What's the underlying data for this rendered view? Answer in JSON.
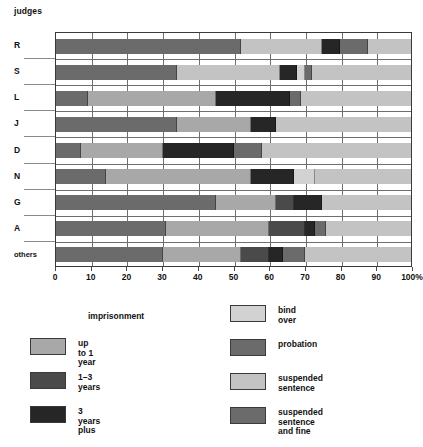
{
  "chart_data": {
    "type": "bar",
    "subtype": "stacked-horizontal-100pct",
    "title": "judges",
    "xlabel": "",
    "ylabel": "",
    "xlim": [
      0,
      100
    ],
    "xunit": "%",
    "grid": true,
    "legend_position": "bottom",
    "xticks": [
      {
        "value": 0,
        "label": "0"
      },
      {
        "value": 10,
        "label": "10"
      },
      {
        "value": 20,
        "label": "20"
      },
      {
        "value": 30,
        "label": "30"
      },
      {
        "value": 40,
        "label": "40"
      },
      {
        "value": 50,
        "label": "50"
      },
      {
        "value": 60,
        "label": "60"
      },
      {
        "value": 70,
        "label": "70"
      },
      {
        "value": 80,
        "label": "80"
      },
      {
        "value": 90,
        "label": "90"
      },
      {
        "value": 100,
        "label": "100%"
      }
    ],
    "categories": [
      "R",
      "S",
      "L",
      "J",
      "D",
      "N",
      "G",
      "A",
      "others"
    ],
    "series": [
      {
        "name": "up to 1 year",
        "key": "up_to_1_year",
        "color": "#a8a8a8",
        "values": [
          0,
          0,
          36,
          21,
          23,
          41,
          17,
          29,
          22
        ]
      },
      {
        "name": "1–3 years",
        "key": "one_to_three_years",
        "color": "#4a4a4a",
        "values": [
          0,
          0,
          0,
          0,
          0,
          0,
          5,
          10,
          10
        ]
      },
      {
        "name": "3 years plus",
        "key": "three_years_plus",
        "color": "#262626",
        "values": [
          5,
          5,
          21,
          7,
          20,
          12,
          8,
          3,
          4
        ]
      },
      {
        "name": "bind over",
        "key": "bind_over",
        "color": "#d2d2d2",
        "values": [
          0,
          2,
          0,
          0,
          0,
          6,
          0,
          0,
          0
        ]
      },
      {
        "name": "probation",
        "key": "probation",
        "color": "#6b6b6b",
        "values": [
          52,
          34,
          9,
          34,
          7,
          14,
          45,
          31,
          30
        ]
      },
      {
        "name": "suspended sentence",
        "key": "suspended_sentence",
        "color": "#c3c3c3",
        "values": [
          35,
          57,
          31,
          38,
          42,
          27,
          25,
          24,
          30
        ]
      },
      {
        "name": "suspended sentence and fine",
        "key": "suspended_and_fine",
        "color": "#6b6b6b",
        "values": [
          8,
          2,
          3,
          0,
          8,
          0,
          0,
          3,
          4
        ]
      }
    ],
    "rows": [
      {
        "category": "R",
        "segments": [
          {
            "key": "probation",
            "label": "probation",
            "start": 0,
            "end": 52,
            "value": 52,
            "color": "#6b6b6b"
          },
          {
            "key": "suspended_sentence",
            "label": "suspended sentence",
            "start": 52,
            "end": 75,
            "value": 23,
            "color": "#c3c3c3"
          },
          {
            "key": "three_years_plus",
            "label": "3 years plus",
            "start": 75,
            "end": 80,
            "value": 5,
            "color": "#262626"
          },
          {
            "key": "suspended_and_fine",
            "label": "suspended sentence and fine",
            "start": 80,
            "end": 88,
            "value": 8,
            "color": "#6b6b6b"
          },
          {
            "key": "suspended_sentence",
            "label": "suspended sentence",
            "start": 88,
            "end": 100,
            "value": 12,
            "color": "#c3c3c3"
          }
        ]
      },
      {
        "category": "S",
        "segments": [
          {
            "key": "probation",
            "label": "probation",
            "start": 0,
            "end": 34,
            "value": 34,
            "color": "#6b6b6b"
          },
          {
            "key": "suspended_sentence",
            "label": "suspended sentence",
            "start": 34,
            "end": 63,
            "value": 29,
            "color": "#c3c3c3"
          },
          {
            "key": "three_years_plus",
            "label": "3 years plus",
            "start": 63,
            "end": 68,
            "value": 5,
            "color": "#262626"
          },
          {
            "key": "bind_over",
            "label": "bind over",
            "start": 68,
            "end": 70,
            "value": 2,
            "color": "#d2d2d2"
          },
          {
            "key": "suspended_and_fine",
            "label": "suspended sentence and fine",
            "start": 70,
            "end": 72,
            "value": 2,
            "color": "#6b6b6b"
          },
          {
            "key": "suspended_sentence",
            "label": "suspended sentence",
            "start": 72,
            "end": 100,
            "value": 28,
            "color": "#c3c3c3"
          }
        ]
      },
      {
        "category": "L",
        "segments": [
          {
            "key": "probation",
            "label": "probation",
            "start": 0,
            "end": 9,
            "value": 9,
            "color": "#6b6b6b"
          },
          {
            "key": "up_to_1_year",
            "label": "up to 1 year",
            "start": 9,
            "end": 45,
            "value": 36,
            "color": "#a8a8a8"
          },
          {
            "key": "three_years_plus",
            "label": "3 years plus",
            "start": 45,
            "end": 66,
            "value": 21,
            "color": "#262626"
          },
          {
            "key": "suspended_and_fine",
            "label": "suspended sentence and fine",
            "start": 66,
            "end": 69,
            "value": 3,
            "color": "#6b6b6b"
          },
          {
            "key": "suspended_sentence",
            "label": "suspended sentence",
            "start": 69,
            "end": 100,
            "value": 31,
            "color": "#c3c3c3"
          }
        ]
      },
      {
        "category": "J",
        "segments": [
          {
            "key": "probation",
            "label": "probation",
            "start": 0,
            "end": 34,
            "value": 34,
            "color": "#6b6b6b"
          },
          {
            "key": "up_to_1_year",
            "label": "up to 1 year",
            "start": 34,
            "end": 55,
            "value": 21,
            "color": "#a8a8a8"
          },
          {
            "key": "three_years_plus",
            "label": "3 years plus",
            "start": 55,
            "end": 62,
            "value": 7,
            "color": "#262626"
          },
          {
            "key": "suspended_sentence",
            "label": "suspended sentence",
            "start": 62,
            "end": 100,
            "value": 38,
            "color": "#c3c3c3"
          }
        ]
      },
      {
        "category": "D",
        "segments": [
          {
            "key": "probation",
            "label": "probation",
            "start": 0,
            "end": 7,
            "value": 7,
            "color": "#6b6b6b"
          },
          {
            "key": "up_to_1_year",
            "label": "up to 1 year",
            "start": 7,
            "end": 30,
            "value": 23,
            "color": "#a8a8a8"
          },
          {
            "key": "three_years_plus",
            "label": "3 years plus",
            "start": 30,
            "end": 50,
            "value": 20,
            "color": "#262626"
          },
          {
            "key": "suspended_and_fine",
            "label": "suspended sentence and fine",
            "start": 50,
            "end": 58,
            "value": 8,
            "color": "#6b6b6b"
          },
          {
            "key": "suspended_sentence",
            "label": "suspended sentence",
            "start": 58,
            "end": 100,
            "value": 42,
            "color": "#c3c3c3"
          }
        ]
      },
      {
        "category": "N",
        "segments": [
          {
            "key": "probation",
            "label": "probation",
            "start": 0,
            "end": 14,
            "value": 14,
            "color": "#6b6b6b"
          },
          {
            "key": "up_to_1_year",
            "label": "up to 1 year",
            "start": 14,
            "end": 55,
            "value": 41,
            "color": "#a8a8a8"
          },
          {
            "key": "three_years_plus",
            "label": "3 years plus",
            "start": 55,
            "end": 67,
            "value": 12,
            "color": "#262626"
          },
          {
            "key": "bind_over",
            "label": "bind over",
            "start": 67,
            "end": 73,
            "value": 6,
            "color": "#d2d2d2"
          },
          {
            "key": "suspended_sentence",
            "label": "suspended sentence",
            "start": 73,
            "end": 100,
            "value": 27,
            "color": "#c3c3c3"
          }
        ]
      },
      {
        "category": "G",
        "segments": [
          {
            "key": "probation",
            "label": "probation",
            "start": 0,
            "end": 45,
            "value": 45,
            "color": "#6b6b6b"
          },
          {
            "key": "up_to_1_year",
            "label": "up to 1 year",
            "start": 45,
            "end": 62,
            "value": 17,
            "color": "#a8a8a8"
          },
          {
            "key": "one_to_three_years",
            "label": "1–3 years",
            "start": 62,
            "end": 67,
            "value": 5,
            "color": "#4a4a4a"
          },
          {
            "key": "three_years_plus",
            "label": "3 years plus",
            "start": 67,
            "end": 75,
            "value": 8,
            "color": "#262626"
          },
          {
            "key": "suspended_sentence",
            "label": "suspended sentence",
            "start": 75,
            "end": 100,
            "value": 25,
            "color": "#c3c3c3"
          }
        ]
      },
      {
        "category": "A",
        "segments": [
          {
            "key": "probation",
            "label": "probation",
            "start": 0,
            "end": 31,
            "value": 31,
            "color": "#6b6b6b"
          },
          {
            "key": "up_to_1_year",
            "label": "up to 1 year",
            "start": 31,
            "end": 60,
            "value": 29,
            "color": "#a8a8a8"
          },
          {
            "key": "one_to_three_years",
            "label": "1–3 years",
            "start": 60,
            "end": 70,
            "value": 10,
            "color": "#4a4a4a"
          },
          {
            "key": "three_years_plus",
            "label": "3 years plus",
            "start": 70,
            "end": 73,
            "value": 3,
            "color": "#262626"
          },
          {
            "key": "suspended_and_fine",
            "label": "suspended sentence and fine",
            "start": 73,
            "end": 76,
            "value": 3,
            "color": "#6b6b6b"
          },
          {
            "key": "suspended_sentence",
            "label": "suspended sentence",
            "start": 76,
            "end": 100,
            "value": 24,
            "color": "#c3c3c3"
          }
        ]
      },
      {
        "category": "others",
        "segments": [
          {
            "key": "probation",
            "label": "probation",
            "start": 0,
            "end": 30,
            "value": 30,
            "color": "#6b6b6b"
          },
          {
            "key": "up_to_1_year",
            "label": "up to 1 year",
            "start": 30,
            "end": 52,
            "value": 22,
            "color": "#a8a8a8"
          },
          {
            "key": "one_to_three_years",
            "label": "1–3 years",
            "start": 52,
            "end": 60,
            "value": 8,
            "color": "#4a4a4a"
          },
          {
            "key": "three_years_plus",
            "label": "3 years plus",
            "start": 60,
            "end": 64,
            "value": 4,
            "color": "#262626"
          },
          {
            "key": "suspended_and_fine",
            "label": "suspended sentence and fine",
            "start": 64,
            "end": 70,
            "value": 6,
            "color": "#6b6b6b"
          },
          {
            "key": "suspended_sentence",
            "label": "suspended sentence",
            "start": 70,
            "end": 100,
            "value": 30,
            "color": "#c3c3c3"
          }
        ]
      }
    ]
  },
  "legend": {
    "left": {
      "heading": "imprisonment",
      "items": [
        {
          "label": "up to 1 year",
          "color": "#a8a8a8",
          "key": "up_to_1_year"
        },
        {
          "label": "1–3 years",
          "color": "#4a4a4a",
          "key": "one_to_three_years"
        },
        {
          "label": "3 years plus",
          "color": "#262626",
          "key": "three_years_plus"
        }
      ]
    },
    "right": {
      "heading": "",
      "items": [
        {
          "label": "bind over",
          "color": "#d2d2d2",
          "key": "bind_over"
        },
        {
          "label": "probation",
          "color": "#6b6b6b",
          "key": "probation"
        },
        {
          "label": "suspended sentence",
          "color": "#c3c3c3",
          "key": "suspended_sentence"
        },
        {
          "label": "suspended sentence\nand fine",
          "color": "#6b6b6b",
          "key": "suspended_and_fine"
        }
      ]
    }
  },
  "colors": {
    "up_to_1_year": "#a8a8a8",
    "one_to_three_years": "#4a4a4a",
    "three_years_plus": "#262626",
    "bind_over": "#d2d2d2",
    "probation": "#6b6b6b",
    "suspended_sentence": "#c3c3c3",
    "suspended_and_fine": "#6b6b6b",
    "grid": "#6e6e6e",
    "axis": "#3a3a3a",
    "background": "#ffffff",
    "text": "#111111"
  }
}
